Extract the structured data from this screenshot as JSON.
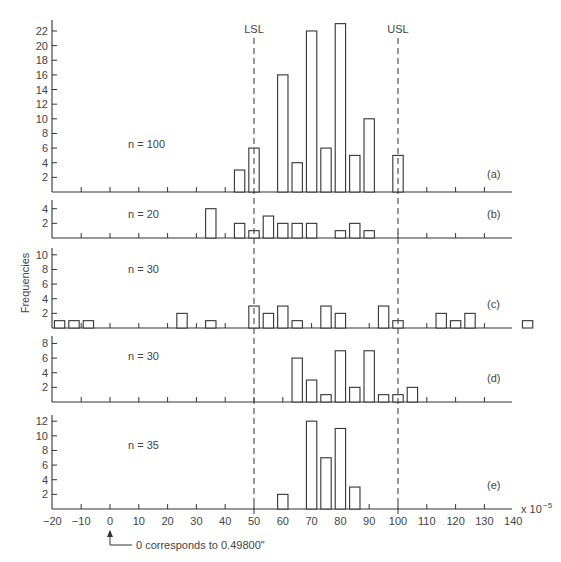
{
  "chart_data": {
    "type": "bar",
    "title": "",
    "ylabel": "Frequencies",
    "xlabel": "",
    "x_unit": "x 10^-5",
    "x_tick_labels": [
      "-20",
      "-10",
      "0",
      "10",
      "20",
      "30",
      "40",
      "50",
      "60",
      "70",
      "80",
      "90",
      "100",
      "110",
      "120",
      "130",
      "140"
    ],
    "xlim": [
      -20,
      140
    ],
    "spec_limits": [
      {
        "name": "LSL",
        "x": 50
      },
      {
        "name": "USL",
        "x": 100
      }
    ],
    "footnote": "0 corresponds to 0.49800\"",
    "panels": [
      {
        "id": "(a)",
        "n_label": "n = 100",
        "y_ticks": [
          2,
          4,
          6,
          8,
          10,
          12,
          14,
          16,
          18,
          20,
          22
        ],
        "ylim": [
          0,
          23
        ],
        "bars": [
          {
            "x": 45,
            "value": 3
          },
          {
            "x": 50,
            "value": 6
          },
          {
            "x": 60,
            "value": 16
          },
          {
            "x": 65,
            "value": 4
          },
          {
            "x": 70,
            "value": 22
          },
          {
            "x": 75,
            "value": 6
          },
          {
            "x": 80,
            "value": 23
          },
          {
            "x": 85,
            "value": 5
          },
          {
            "x": 90,
            "value": 10
          },
          {
            "x": 100,
            "value": 5
          }
        ]
      },
      {
        "id": "(b)",
        "n_label": "n = 20",
        "y_ticks": [
          2,
          4
        ],
        "ylim": [
          0,
          5
        ],
        "bars": [
          {
            "x": 35,
            "value": 4
          },
          {
            "x": 45,
            "value": 2
          },
          {
            "x": 50,
            "value": 1
          },
          {
            "x": 55,
            "value": 3
          },
          {
            "x": 60,
            "value": 2
          },
          {
            "x": 65,
            "value": 2
          },
          {
            "x": 70,
            "value": 2
          },
          {
            "x": 80,
            "value": 1
          },
          {
            "x": 85,
            "value": 2
          },
          {
            "x": 90,
            "value": 1
          }
        ]
      },
      {
        "id": "(c)",
        "n_label": "n = 30",
        "y_ticks": [
          2,
          4,
          6,
          8,
          10
        ],
        "ylim": [
          0,
          11
        ],
        "bars": [
          {
            "x": -17.5,
            "value": 1
          },
          {
            "x": -12.5,
            "value": 1
          },
          {
            "x": -7.5,
            "value": 1
          },
          {
            "x": 25,
            "value": 2
          },
          {
            "x": 35,
            "value": 1
          },
          {
            "x": 50,
            "value": 3
          },
          {
            "x": 55,
            "value": 2
          },
          {
            "x": 60,
            "value": 3
          },
          {
            "x": 65,
            "value": 1
          },
          {
            "x": 75,
            "value": 3
          },
          {
            "x": 80,
            "value": 2
          },
          {
            "x": 95,
            "value": 3
          },
          {
            "x": 100,
            "value": 1
          },
          {
            "x": 115,
            "value": 2
          },
          {
            "x": 120,
            "value": 1
          },
          {
            "x": 125,
            "value": 2
          },
          {
            "x": 145,
            "value": 1
          }
        ]
      },
      {
        "id": "(d)",
        "n_label": "n = 30",
        "y_ticks": [
          2,
          4,
          6,
          8
        ],
        "ylim": [
          0,
          9
        ],
        "bars": [
          {
            "x": 65,
            "value": 6
          },
          {
            "x": 70,
            "value": 3
          },
          {
            "x": 75,
            "value": 1
          },
          {
            "x": 80,
            "value": 7
          },
          {
            "x": 85,
            "value": 2
          },
          {
            "x": 90,
            "value": 7
          },
          {
            "x": 95,
            "value": 1
          },
          {
            "x": 100,
            "value": 1
          },
          {
            "x": 105,
            "value": 2
          }
        ]
      },
      {
        "id": "(e)",
        "n_label": "n = 35",
        "y_ticks": [
          2,
          4,
          6,
          8,
          10,
          12
        ],
        "ylim": [
          0,
          13
        ],
        "bars": [
          {
            "x": 60,
            "value": 2
          },
          {
            "x": 70,
            "value": 12
          },
          {
            "x": 75,
            "value": 7
          },
          {
            "x": 80,
            "value": 11
          },
          {
            "x": 85,
            "value": 3
          }
        ]
      }
    ]
  },
  "layout_hints": {
    "panel_baselines_px": [
      192,
      238,
      328,
      402,
      509
    ],
    "panel_top_px": [
      20,
      200,
      248,
      336,
      415
    ],
    "px_per_unit_y": 7.32,
    "x_zero_px": 110,
    "px_per_unit_x": 2.88,
    "axis_left_px": 52,
    "axis_right_px": 512
  }
}
